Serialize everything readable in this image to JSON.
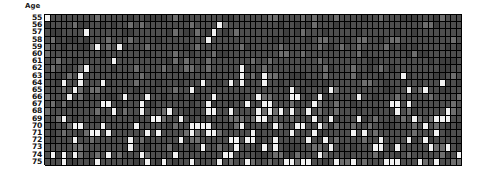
{
  "axis": {
    "y_title": "Age",
    "y_tick_labels": [
      "55",
      "56",
      "57",
      "58",
      "59",
      "60",
      "61",
      "62",
      "63",
      "64",
      "65",
      "66",
      "67",
      "68",
      "69",
      "70",
      "71",
      "72",
      "73",
      "74",
      "75"
    ]
  },
  "colors": {
    "background": "#ffffff",
    "cell_base": "#4e4e4e",
    "cell_event": "#f2f2f2",
    "cell_mid": "#6e6e6e",
    "cell_dim": "#3f3f3f",
    "gridline": "#000000",
    "text": "#111111"
  },
  "chart_data": {
    "type": "heatmap",
    "title": "",
    "xlabel": "",
    "ylabel": "Age",
    "grid": true,
    "legend": "none",
    "rows": 21,
    "columns": 75,
    "ylim": [
      55,
      75
    ],
    "y_categories": [
      "55",
      "56",
      "57",
      "58",
      "59",
      "60",
      "61",
      "62",
      "63",
      "64",
      "65",
      "66",
      "67",
      "68",
      "69",
      "70",
      "71",
      "72",
      "73",
      "74",
      "75"
    ],
    "value_levels": {
      "0": "no-event (dark gray cell)",
      "1": "event (white cell)"
    },
    "event_rate_by_age": [
      0.012,
      0.012,
      0.018,
      0.022,
      0.022,
      0.028,
      0.046,
      0.055,
      0.07,
      0.085,
      0.095,
      0.12,
      0.11,
      0.14,
      0.15,
      0.175,
      0.16,
      0.155,
      0.185,
      0.18,
      0.23
    ],
    "matrix": [
      [
        1,
        0,
        0,
        0,
        0,
        0,
        0,
        0,
        0,
        0,
        0,
        0,
        0,
        0,
        0,
        0,
        0,
        0,
        0,
        0,
        0,
        0,
        0,
        0,
        0,
        0,
        0,
        0,
        0,
        0,
        0,
        0,
        0,
        0,
        0,
        0,
        0,
        0,
        0,
        0,
        0,
        0,
        0,
        0,
        0,
        0,
        0,
        0,
        0,
        0,
        0,
        0,
        0,
        0,
        0,
        0,
        0,
        0,
        0,
        0,
        0,
        0,
        0,
        0,
        0,
        0,
        0,
        0,
        0,
        0,
        0,
        0,
        0,
        0,
        0
      ],
      [
        0,
        0,
        0,
        0,
        0,
        0,
        0,
        0,
        0,
        0,
        0,
        0,
        0,
        0,
        0,
        0,
        0,
        0,
        0,
        0,
        0,
        0,
        0,
        0,
        0,
        0,
        0,
        0,
        0,
        0,
        0,
        0,
        0,
        0,
        0,
        0,
        0,
        0,
        0,
        0,
        0,
        0,
        0,
        0,
        0,
        0,
        0,
        0,
        0,
        0,
        0,
        0,
        0,
        0,
        0,
        0,
        0,
        0,
        0,
        0,
        0,
        0,
        0,
        0,
        0,
        0,
        0,
        0,
        0,
        0,
        0,
        0,
        0,
        0,
        0
      ],
      [
        0,
        0,
        0,
        0,
        0,
        0,
        0,
        0,
        0,
        0,
        0,
        0,
        0,
        0,
        0,
        0,
        0,
        0,
        0,
        0,
        0,
        0,
        0,
        0,
        0,
        0,
        0,
        0,
        0,
        0,
        0,
        0,
        0,
        0,
        0,
        0,
        0,
        0,
        0,
        0,
        0,
        0,
        0,
        0,
        0,
        0,
        0,
        0,
        0,
        0,
        0,
        0,
        0,
        0,
        0,
        0,
        0,
        0,
        0,
        0,
        0,
        0,
        0,
        0,
        0,
        0,
        0,
        0,
        0,
        0,
        0,
        0,
        0,
        0,
        0
      ],
      [
        0,
        0,
        0,
        0,
        0,
        0,
        0,
        0,
        0,
        0,
        0,
        0,
        0,
        0,
        0,
        0,
        0,
        0,
        0,
        0,
        0,
        0,
        0,
        0,
        0,
        0,
        0,
        0,
        0,
        0,
        0,
        0,
        0,
        0,
        0,
        0,
        0,
        0,
        0,
        0,
        0,
        0,
        0,
        0,
        0,
        0,
        0,
        0,
        0,
        0,
        0,
        0,
        0,
        0,
        0,
        0,
        0,
        0,
        0,
        0,
        0,
        0,
        0,
        0,
        0,
        0,
        0,
        0,
        0,
        0,
        0,
        0,
        0,
        0,
        0
      ],
      [
        0,
        0,
        0,
        0,
        0,
        0,
        0,
        0,
        0,
        0,
        0,
        0,
        0,
        0,
        0,
        0,
        0,
        0,
        0,
        0,
        0,
        0,
        0,
        0,
        0,
        0,
        0,
        0,
        0,
        0,
        0,
        0,
        0,
        0,
        0,
        0,
        0,
        0,
        0,
        0,
        0,
        0,
        0,
        0,
        0,
        0,
        0,
        0,
        0,
        0,
        0,
        0,
        0,
        0,
        0,
        0,
        0,
        0,
        0,
        0,
        0,
        0,
        0,
        0,
        0,
        0,
        0,
        0,
        0,
        0,
        0,
        0,
        0,
        0,
        0
      ],
      [
        0,
        0,
        0,
        0,
        0,
        0,
        0,
        0,
        0,
        0,
        0,
        0,
        0,
        0,
        0,
        0,
        0,
        0,
        0,
        0,
        0,
        0,
        0,
        0,
        0,
        0,
        0,
        0,
        0,
        0,
        0,
        0,
        0,
        0,
        0,
        0,
        0,
        0,
        0,
        0,
        0,
        0,
        0,
        0,
        0,
        0,
        0,
        0,
        0,
        0,
        0,
        0,
        0,
        0,
        0,
        0,
        0,
        0,
        0,
        0,
        0,
        0,
        0,
        0,
        0,
        0,
        0,
        0,
        0,
        0,
        0,
        0,
        0,
        0,
        0
      ],
      [
        0,
        0,
        0,
        0,
        0,
        0,
        0,
        0,
        0,
        0,
        0,
        0,
        0,
        0,
        0,
        0,
        0,
        0,
        0,
        0,
        0,
        0,
        0,
        0,
        0,
        0,
        0,
        0,
        0,
        0,
        0,
        0,
        0,
        0,
        0,
        0,
        0,
        0,
        0,
        0,
        0,
        0,
        0,
        0,
        0,
        0,
        0,
        0,
        0,
        0,
        0,
        0,
        0,
        0,
        0,
        0,
        0,
        0,
        0,
        0,
        0,
        0,
        0,
        0,
        0,
        0,
        0,
        0,
        0,
        0,
        0,
        0,
        0,
        0,
        0
      ],
      [
        0,
        0,
        0,
        0,
        0,
        0,
        0,
        0,
        0,
        0,
        0,
        0,
        0,
        0,
        0,
        0,
        0,
        0,
        0,
        0,
        0,
        0,
        0,
        0,
        0,
        0,
        0,
        0,
        0,
        0,
        0,
        0,
        0,
        0,
        0,
        0,
        0,
        0,
        0,
        0,
        0,
        0,
        0,
        0,
        0,
        0,
        0,
        0,
        0,
        0,
        0,
        0,
        0,
        0,
        0,
        0,
        0,
        0,
        0,
        0,
        0,
        0,
        0,
        0,
        0,
        0,
        0,
        0,
        0,
        0,
        0,
        0,
        0,
        0,
        0
      ],
      [
        0,
        0,
        0,
        0,
        0,
        0,
        0,
        0,
        0,
        0,
        0,
        0,
        0,
        0,
        0,
        0,
        0,
        0,
        0,
        0,
        0,
        0,
        0,
        0,
        0,
        0,
        0,
        0,
        0,
        0,
        0,
        0,
        0,
        0,
        0,
        0,
        0,
        0,
        0,
        0,
        0,
        0,
        0,
        0,
        0,
        0,
        0,
        0,
        0,
        0,
        0,
        0,
        0,
        0,
        0,
        0,
        0,
        0,
        0,
        0,
        0,
        0,
        0,
        0,
        0,
        0,
        0,
        0,
        0,
        0,
        0,
        0,
        0,
        0,
        0
      ],
      [
        0,
        0,
        0,
        0,
        0,
        0,
        0,
        0,
        0,
        0,
        0,
        0,
        0,
        0,
        0,
        0,
        0,
        0,
        0,
        0,
        0,
        0,
        0,
        0,
        0,
        0,
        0,
        0,
        0,
        0,
        0,
        0,
        0,
        0,
        0,
        0,
        0,
        0,
        0,
        0,
        0,
        0,
        0,
        0,
        0,
        0,
        0,
        0,
        0,
        0,
        0,
        0,
        0,
        0,
        0,
        0,
        0,
        0,
        0,
        0,
        0,
        0,
        0,
        0,
        0,
        0,
        0,
        0,
        0,
        0,
        0,
        0,
        0,
        0,
        0
      ],
      [
        0,
        0,
        0,
        0,
        0,
        0,
        0,
        0,
        0,
        0,
        0,
        0,
        0,
        0,
        0,
        0,
        0,
        0,
        0,
        0,
        0,
        0,
        0,
        0,
        0,
        0,
        0,
        0,
        0,
        0,
        0,
        0,
        0,
        0,
        0,
        0,
        0,
        0,
        0,
        0,
        0,
        0,
        0,
        0,
        0,
        0,
        0,
        0,
        0,
        0,
        0,
        0,
        0,
        0,
        0,
        0,
        0,
        0,
        0,
        0,
        0,
        0,
        0,
        0,
        0,
        0,
        0,
        0,
        0,
        0,
        0,
        0,
        0,
        0,
        0
      ],
      [
        0,
        0,
        0,
        0,
        0,
        0,
        0,
        0,
        0,
        0,
        0,
        0,
        0,
        0,
        0,
        0,
        0,
        0,
        0,
        0,
        0,
        0,
        0,
        0,
        0,
        0,
        0,
        0,
        0,
        0,
        0,
        0,
        0,
        0,
        0,
        0,
        0,
        0,
        0,
        0,
        0,
        0,
        0,
        0,
        0,
        0,
        0,
        0,
        0,
        0,
        0,
        0,
        0,
        0,
        0,
        0,
        0,
        0,
        0,
        0,
        0,
        0,
        0,
        0,
        0,
        0,
        0,
        0,
        0,
        0,
        0,
        0,
        0,
        0,
        0
      ],
      [
        0,
        0,
        0,
        0,
        0,
        0,
        0,
        0,
        0,
        0,
        0,
        0,
        0,
        0,
        0,
        0,
        0,
        0,
        0,
        0,
        0,
        0,
        0,
        0,
        0,
        0,
        0,
        0,
        0,
        0,
        0,
        0,
        0,
        0,
        0,
        0,
        0,
        0,
        0,
        0,
        0,
        0,
        0,
        0,
        0,
        0,
        0,
        0,
        0,
        0,
        0,
        0,
        0,
        0,
        0,
        0,
        0,
        0,
        0,
        0,
        0,
        0,
        0,
        0,
        0,
        0,
        0,
        0,
        0,
        0,
        0,
        0,
        0,
        0,
        0
      ],
      [
        0,
        0,
        0,
        0,
        0,
        0,
        0,
        0,
        0,
        0,
        0,
        0,
        0,
        0,
        0,
        0,
        0,
        0,
        0,
        0,
        0,
        0,
        0,
        0,
        0,
        0,
        0,
        0,
        0,
        0,
        0,
        0,
        0,
        0,
        0,
        0,
        0,
        0,
        0,
        0,
        0,
        0,
        0,
        0,
        0,
        0,
        0,
        0,
        0,
        0,
        0,
        0,
        0,
        0,
        0,
        0,
        0,
        0,
        0,
        0,
        0,
        0,
        0,
        0,
        0,
        0,
        0,
        0,
        0,
        0,
        0,
        0,
        0,
        0,
        0
      ],
      [
        0,
        0,
        0,
        0,
        0,
        0,
        0,
        0,
        0,
        0,
        0,
        0,
        0,
        0,
        0,
        0,
        0,
        0,
        0,
        0,
        0,
        0,
        0,
        0,
        0,
        0,
        0,
        0,
        0,
        0,
        0,
        0,
        0,
        0,
        0,
        0,
        0,
        0,
        0,
        0,
        0,
        0,
        0,
        0,
        0,
        0,
        0,
        0,
        0,
        0,
        0,
        0,
        0,
        0,
        0,
        0,
        0,
        0,
        0,
        0,
        0,
        0,
        0,
        0,
        0,
        0,
        0,
        0,
        0,
        0,
        0,
        0,
        0,
        0,
        0
      ],
      [
        0,
        0,
        0,
        0,
        0,
        0,
        0,
        0,
        0,
        0,
        0,
        0,
        0,
        0,
        0,
        0,
        0,
        0,
        0,
        0,
        0,
        0,
        0,
        0,
        0,
        0,
        0,
        0,
        0,
        0,
        0,
        0,
        0,
        0,
        0,
        0,
        0,
        0,
        0,
        0,
        0,
        0,
        0,
        0,
        0,
        0,
        0,
        0,
        0,
        0,
        0,
        0,
        0,
        0,
        0,
        0,
        0,
        0,
        0,
        0,
        0,
        0,
        0,
        0,
        0,
        0,
        0,
        0,
        0,
        0,
        0,
        0,
        0,
        0,
        0
      ],
      [
        0,
        0,
        0,
        0,
        0,
        0,
        0,
        0,
        0,
        0,
        0,
        0,
        0,
        0,
        0,
        0,
        0,
        0,
        0,
        0,
        0,
        0,
        0,
        0,
        0,
        0,
        0,
        0,
        0,
        0,
        0,
        0,
        0,
        0,
        0,
        0,
        0,
        0,
        0,
        0,
        0,
        0,
        0,
        0,
        0,
        0,
        0,
        0,
        0,
        0,
        0,
        0,
        0,
        0,
        0,
        0,
        0,
        0,
        0,
        0,
        0,
        0,
        0,
        0,
        0,
        0,
        0,
        0,
        0,
        0,
        0,
        0,
        0,
        0,
        0
      ],
      [
        0,
        0,
        0,
        0,
        0,
        0,
        0,
        0,
        0,
        0,
        0,
        0,
        0,
        0,
        0,
        0,
        0,
        0,
        0,
        0,
        0,
        0,
        0,
        0,
        0,
        0,
        0,
        0,
        0,
        0,
        0,
        0,
        0,
        0,
        0,
        0,
        0,
        0,
        0,
        0,
        0,
        0,
        0,
        0,
        0,
        0,
        0,
        0,
        0,
        0,
        0,
        0,
        0,
        0,
        0,
        0,
        0,
        0,
        0,
        0,
        0,
        0,
        0,
        0,
        0,
        0,
        0,
        0,
        0,
        0,
        0,
        0,
        0,
        0,
        0
      ],
      [
        0,
        0,
        0,
        0,
        0,
        0,
        0,
        0,
        0,
        0,
        0,
        0,
        0,
        0,
        0,
        0,
        0,
        0,
        0,
        0,
        0,
        0,
        0,
        0,
        0,
        0,
        0,
        0,
        0,
        0,
        0,
        0,
        0,
        0,
        0,
        0,
        0,
        0,
        0,
        0,
        0,
        0,
        0,
        0,
        0,
        0,
        0,
        0,
        0,
        0,
        0,
        0,
        0,
        0,
        0,
        0,
        0,
        0,
        0,
        0,
        0,
        0,
        0,
        0,
        0,
        0,
        0,
        0,
        0,
        0,
        0,
        0,
        0,
        0,
        0
      ],
      [
        0,
        0,
        0,
        0,
        0,
        0,
        0,
        0,
        0,
        0,
        0,
        0,
        0,
        0,
        0,
        0,
        0,
        0,
        0,
        0,
        0,
        0,
        0,
        0,
        0,
        0,
        0,
        0,
        0,
        0,
        0,
        0,
        0,
        0,
        0,
        0,
        0,
        0,
        0,
        0,
        0,
        0,
        0,
        0,
        0,
        0,
        0,
        0,
        0,
        0,
        0,
        0,
        0,
        0,
        0,
        0,
        0,
        0,
        0,
        0,
        0,
        0,
        0,
        0,
        0,
        0,
        0,
        0,
        0,
        0,
        0,
        0,
        0,
        0,
        0
      ],
      [
        0,
        0,
        0,
        0,
        0,
        0,
        0,
        0,
        0,
        0,
        0,
        0,
        0,
        0,
        0,
        0,
        0,
        0,
        0,
        0,
        0,
        0,
        0,
        0,
        0,
        0,
        0,
        0,
        0,
        0,
        0,
        0,
        0,
        0,
        0,
        0,
        0,
        0,
        0,
        0,
        0,
        0,
        0,
        0,
        0,
        0,
        0,
        0,
        0,
        0,
        0,
        0,
        0,
        0,
        0,
        0,
        0,
        0,
        0,
        0,
        0,
        0,
        0,
        0,
        0,
        0,
        0,
        0,
        0,
        0,
        0,
        0,
        0,
        0,
        0
      ]
    ]
  }
}
